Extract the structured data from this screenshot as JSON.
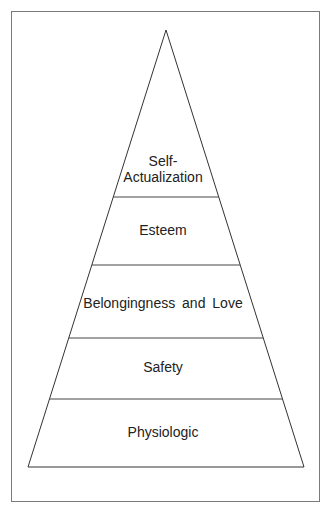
{
  "diagram": {
    "type": "pyramid",
    "levels": [
      {
        "label_line1": "Self-",
        "label_line2": "Actualization"
      },
      {
        "label": "Esteem"
      },
      {
        "label": "Belongingness and Love"
      },
      {
        "label": "Safety"
      },
      {
        "label": "Physiologic"
      }
    ]
  }
}
